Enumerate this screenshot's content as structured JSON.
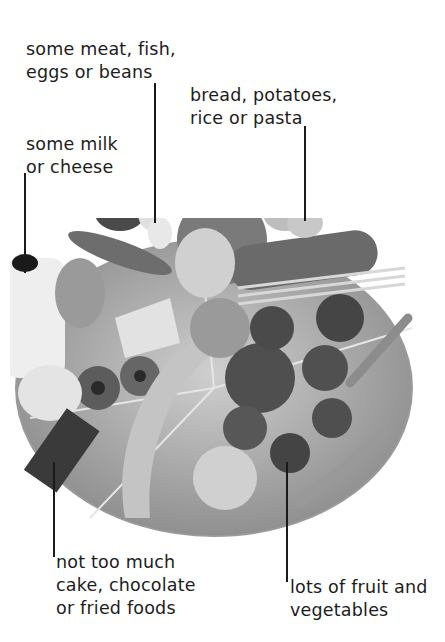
{
  "diagram": {
    "type": "food plate (balanced diet guide)",
    "labels": [
      {
        "id": "meat",
        "lines": [
          "some meat, fish,",
          "eggs or beans"
        ]
      },
      {
        "id": "starch",
        "lines": [
          "bread, potatoes,",
          "rice or pasta"
        ]
      },
      {
        "id": "dairy",
        "lines": [
          "some milk",
          "or cheese"
        ]
      },
      {
        "id": "treats",
        "lines": [
          "not too much",
          "cake, chocolate",
          "or fried foods"
        ]
      },
      {
        "id": "produce",
        "lines": [
          "lots of fruit and",
          "vegetables"
        ]
      }
    ]
  },
  "colors": {
    "background": "#ffffff",
    "text": "#1c1c1c",
    "leader_line": "#1a1a1a",
    "plate_rim": "#9a9a9a",
    "plate_fill": "#b8b8b8"
  }
}
